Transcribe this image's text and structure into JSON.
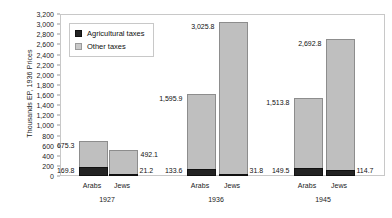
{
  "chart_data": {
    "type": "bar",
    "subtype": "stacked-bar",
    "title": "",
    "xlabel": "",
    "ylabel": "Thousands EP, 1936 Prices",
    "ylim": [
      0,
      3200
    ],
    "ytick_step": 200,
    "grid": false,
    "legend_position": "top-left",
    "ytick_labels": [
      "3,200",
      "3,000",
      "2,800",
      "2,600",
      "2,400",
      "2,200",
      "2,000",
      "1,800",
      "1,600",
      "1,400",
      "1,200",
      "1,000",
      "800",
      "600",
      "400",
      "200",
      "0"
    ],
    "legend": [
      {
        "name": "Agricultural taxes",
        "color": "#232323"
      },
      {
        "name": "Other taxes",
        "color": "#c9c9c9"
      }
    ],
    "groups": [
      "1927",
      "1936",
      "1945"
    ],
    "categories": [
      "Arabs",
      "Jews",
      "Arabs",
      "Jews",
      "Arabs",
      "Jews"
    ],
    "series": [
      {
        "name": "Agricultural taxes",
        "values": [
          169.8,
          21.2,
          133.6,
          31.8,
          149.5,
          114.7
        ]
      },
      {
        "name": "Other taxes",
        "values": [
          505.5,
          470.9,
          1462.3,
          2994.0,
          1364.3,
          2578.1
        ]
      }
    ],
    "totals": [
      675.3,
      492.1,
      1595.9,
      3025.8,
      1513.8,
      2692.8
    ],
    "bars": [
      {
        "group": "1927",
        "category": "Arabs",
        "agricultural": 169.8,
        "total": 675.3,
        "agri_label": "169.8",
        "total_label": "675.3",
        "agri_label_side": "left",
        "total_label_side": "left"
      },
      {
        "group": "1927",
        "category": "Jews",
        "agricultural": 21.2,
        "total": 492.1,
        "agri_label": "21.2",
        "total_label": "492.1",
        "agri_label_side": "right",
        "total_label_side": "right"
      },
      {
        "group": "1936",
        "category": "Arabs",
        "agricultural": 133.6,
        "total": 1595.9,
        "agri_label": "133.6",
        "total_label": "1,595.9",
        "agri_label_side": "left",
        "total_label_side": "left"
      },
      {
        "group": "1936",
        "category": "Jews",
        "agricultural": 31.8,
        "total": 3025.8,
        "agri_label": "31.8",
        "total_label": "3,025.8",
        "agri_label_side": "right",
        "total_label_side": "left"
      },
      {
        "group": "1945",
        "category": "Arabs",
        "agricultural": 149.5,
        "total": 1513.8,
        "agri_label": "149.5",
        "total_label": "1,513.8",
        "agri_label_side": "left",
        "total_label_side": "left"
      },
      {
        "group": "1945",
        "category": "Jews",
        "agricultural": 114.7,
        "total": 2692.8,
        "agri_label": "114.7",
        "total_label": "2,692.8",
        "agri_label_side": "right",
        "total_label_side": "left"
      }
    ]
  },
  "axis": {
    "y_title": "Thousands EP, 1936 Prices"
  },
  "group_labels": [
    {
      "label": "1927"
    },
    {
      "label": "1936"
    },
    {
      "label": "1945"
    }
  ],
  "colors": {
    "agricultural": "#232323",
    "other": "#c9c9c9",
    "plot_border": "#c8c8c8",
    "background": "#ffffff"
  }
}
